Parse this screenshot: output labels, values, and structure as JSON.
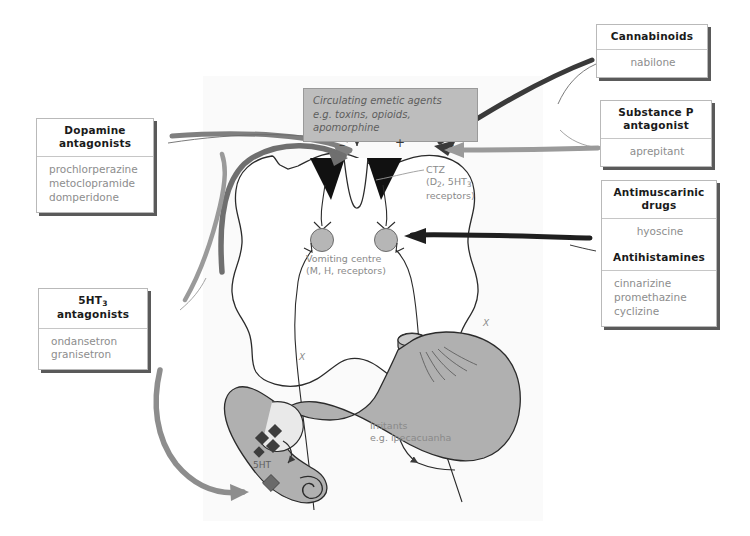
{
  "figure": {
    "panel_bg": "#fafafa",
    "accent_gray": "#8a8a8a"
  },
  "emetic_label": {
    "line1": "Circulating emetic agents",
    "line2": "e.g. toxins, opioids, apomorphine"
  },
  "anatomy": {
    "ctz_line1": "CTZ",
    "ctz_line2": "(D",
    "ctz_sub1": "2",
    "ctz_line2b": ", 5HT",
    "ctz_sub2": "3",
    "ctz_line3": "receptors)",
    "vomiting_centre_line1": "Vomiting centre",
    "vomiting_centre_line2": "(M, H, receptors)",
    "irritants_line1": "Irritants",
    "irritants_line2": "e.g. ipecacuanha",
    "vagus_label": "X",
    "serotonin_label": "5HT"
  },
  "signs": {
    "minus_left": "–",
    "plus_middle": "+",
    "minus_right": "–"
  },
  "boxes": {
    "dopamine": {
      "header_line1": "Dopamine",
      "header_line2": "antagonists",
      "drugs": [
        "prochlorperazine",
        "metoclopramide",
        "domperidone"
      ]
    },
    "serotonin": {
      "header_line1": "5HT",
      "header_sub": "3",
      "header_line2": "antagonists",
      "drugs": [
        "ondansetron",
        "granisetron"
      ]
    },
    "cannabinoids": {
      "header_line1": "Cannabinoids",
      "drugs": [
        "nabilone"
      ]
    },
    "substance_p": {
      "header_line1": "Substance P",
      "header_line2": "antagonist",
      "drugs": [
        "aprepitant"
      ]
    },
    "antimuscarinic": {
      "header_line1": "Antimuscarinic",
      "header_line2": "drugs",
      "drugs": [
        "hyoscine"
      ],
      "header2_line1": "Antihistamines",
      "drugs2": [
        "cinnarizine",
        "promethazine",
        "cyclizine"
      ]
    }
  }
}
